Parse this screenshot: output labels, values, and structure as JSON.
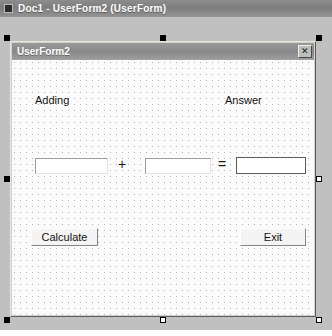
{
  "window": {
    "title": "Doc1 - UserForm2 (UserForm)",
    "system_icon": "form-system-icon"
  },
  "userform": {
    "title": "UserForm2",
    "close_label": "✕",
    "labels": [
      {
        "name": "adding",
        "text": "Adding"
      },
      {
        "name": "answer",
        "text": "Answer"
      }
    ],
    "textboxes": [
      {
        "name": "operand-1",
        "value": ""
      },
      {
        "name": "operand-2",
        "value": ""
      },
      {
        "name": "result",
        "value": ""
      }
    ],
    "operators": [
      {
        "name": "plus",
        "text": "+"
      },
      {
        "name": "equals",
        "text": "="
      }
    ],
    "buttons": [
      {
        "name": "calculate",
        "text": "Calculate"
      },
      {
        "name": "exit",
        "text": "Exit"
      }
    ]
  },
  "colors": {
    "titlebar": "#7d7d7d",
    "form_face": "#d4d0c8",
    "canvas": "#fbfbfb",
    "grid_dot": "#b4b4b4",
    "workspace": "#c0c0c0",
    "selected_border": "#5a5a5a"
  }
}
